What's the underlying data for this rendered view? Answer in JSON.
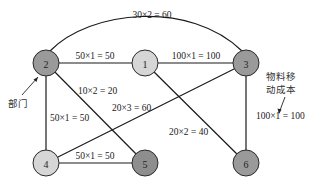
{
  "diagram": {
    "nodes": [
      {
        "id": "1",
        "label": "1",
        "color": "#d6d6d6"
      },
      {
        "id": "2",
        "label": "2",
        "color": "#9a9a9a"
      },
      {
        "id": "3",
        "label": "3",
        "color": "#9a9a9a"
      },
      {
        "id": "4",
        "label": "4",
        "color": "#d6d6d6"
      },
      {
        "id": "5",
        "label": "5",
        "color": "#8e8e8e"
      },
      {
        "id": "6",
        "label": "6",
        "color": "#9a9a9a"
      }
    ],
    "edges": [
      {
        "from": "2",
        "to": "3",
        "label": "30×2 = 60",
        "curved": true
      },
      {
        "from": "2",
        "to": "1",
        "label": "50×1 = 50"
      },
      {
        "from": "1",
        "to": "3",
        "label": "100×1 = 100"
      },
      {
        "from": "2",
        "to": "5",
        "label": "10×2 = 20"
      },
      {
        "from": "4",
        "to": "3",
        "label": "20×3 = 60"
      },
      {
        "from": "2",
        "to": "4",
        "label": "50×1 = 50"
      },
      {
        "from": "1",
        "to": "6",
        "label": "20×2 = 40"
      },
      {
        "from": "3",
        "to": "6",
        "label": ""
      },
      {
        "from": "4",
        "to": "5",
        "label": "50×1 = 50"
      }
    ],
    "annotations": {
      "department": "部门",
      "material_cost_line1": "物料移",
      "material_cost_line2": "动成本",
      "material_cost_example": "100×1 = 100"
    }
  }
}
